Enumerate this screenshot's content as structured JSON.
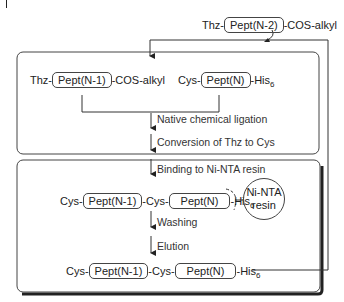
{
  "diagram": {
    "type": "flowchart",
    "colors": {
      "line": "#333333",
      "background": "#ffffff"
    },
    "input_top": {
      "prefix": "Thz-",
      "peptide": "Pept(N-2)",
      "suffix": "-COS-alkyl"
    },
    "box1": {
      "left_reactant": {
        "prefix": "Thz-",
        "peptide": "Pept(N-1)",
        "suffix": "-COS-alkyl"
      },
      "right_reactant": {
        "prefix": "Cys-",
        "peptide": "Pept(N)",
        "suffix": "-His",
        "subscript": "6"
      },
      "steps": [
        "Native chemical ligation",
        "Conversion of Thz to Cys"
      ]
    },
    "box2": {
      "steps": [
        "Binding to Ni-NTA resin",
        "Washing",
        "Elution"
      ],
      "bound_product": {
        "prefix": "Cys-",
        "peptide1": "Pept(N-1)",
        "middle": "-Cys-",
        "peptide2": "Pept(N)",
        "suffix": "-His",
        "subscript": "6"
      },
      "resin": {
        "line1": "Ni-NTA",
        "line2": "resin"
      },
      "eluted_product": {
        "prefix": "Cys-",
        "peptide1": "Pept(N-1)",
        "middle": "-Cys-",
        "peptide2": "Pept(N)",
        "suffix": "-His",
        "subscript": "6"
      }
    }
  }
}
